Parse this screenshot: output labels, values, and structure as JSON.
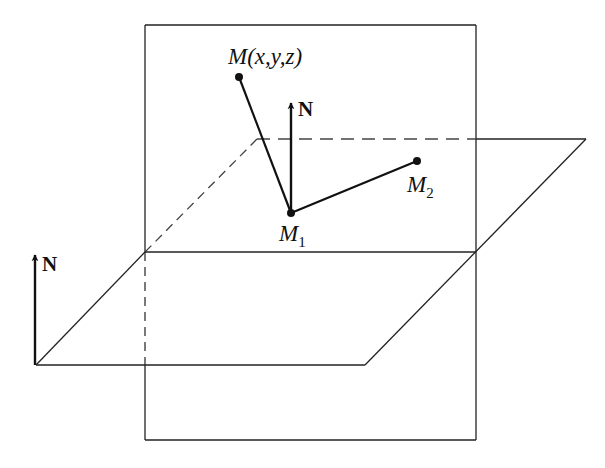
{
  "diagram": {
    "colors": {
      "line": "#222222",
      "dashed": "#444444",
      "background": "#ffffff"
    },
    "points": {
      "M": {
        "label": "M(x,y,z)",
        "x": 239,
        "y": 77
      },
      "M1": {
        "label_main": "M",
        "label_sub": "1",
        "x": 291,
        "y": 213
      },
      "M2": {
        "label_main": "M",
        "label_sub": "2",
        "x": 417,
        "y": 161
      }
    },
    "vectors": [
      {
        "label": "N",
        "position": "center",
        "from": [
          291,
          213
        ],
        "to": [
          291,
          100
        ]
      },
      {
        "label": "N",
        "position": "left",
        "from": [
          35,
          365
        ],
        "to": [
          35,
          252
        ]
      }
    ],
    "labels": {
      "M": "M(x,y,z)",
      "M1_main": "M",
      "M1_sub": "1",
      "M2_main": "M",
      "M2_sub": "2",
      "N_center": "N",
      "N_left": "N"
    }
  }
}
